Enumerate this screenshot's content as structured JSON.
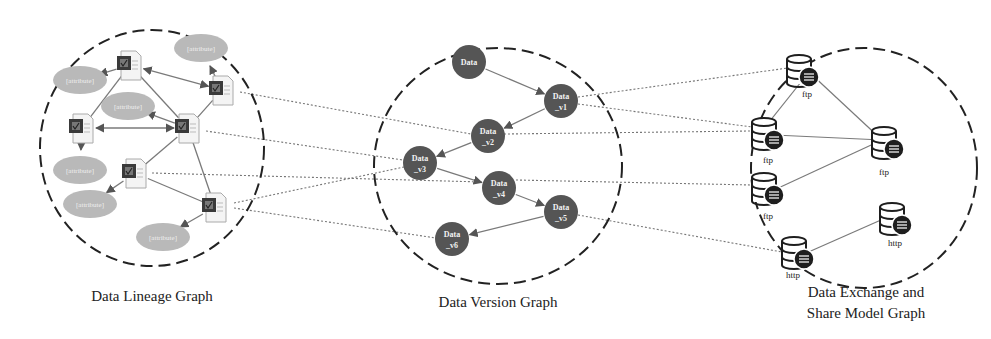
{
  "colors": {
    "background": "#ffffff",
    "boundary": "#222222",
    "cross_link": "#777777",
    "edge": "#7a7a7a",
    "version_node": "#555555",
    "version_text": "#f2f2f2",
    "attribute_fill": "#b9b9b9",
    "attribute_text": "#efefef",
    "doc_dark": "#3a3a3a",
    "db_icon": "#1e1e1e"
  },
  "panels": {
    "lineage": {
      "caption": "Data Lineage Graph",
      "documents": [
        {
          "id": "d1",
          "x": 130,
          "y": 65
        },
        {
          "id": "d2",
          "x": 222,
          "y": 90
        },
        {
          "id": "d3",
          "x": 82,
          "y": 128
        },
        {
          "id": "d4",
          "x": 188,
          "y": 128
        },
        {
          "id": "d5",
          "x": 135,
          "y": 173
        },
        {
          "id": "d6",
          "x": 215,
          "y": 207
        }
      ],
      "attributes": [
        {
          "id": "a1",
          "label": "[attribute]",
          "x": 201,
          "y": 48
        },
        {
          "id": "a2",
          "label": "[attribute]",
          "x": 80,
          "y": 80
        },
        {
          "id": "a3",
          "label": "[attribute]",
          "x": 128,
          "y": 106
        },
        {
          "id": "a4",
          "label": "[attribute]",
          "x": 80,
          "y": 170
        },
        {
          "id": "a5",
          "label": "[attribute]",
          "x": 90,
          "y": 204
        },
        {
          "id": "a6",
          "label": "[attribute]",
          "x": 163,
          "y": 237
        }
      ]
    },
    "version": {
      "caption": "Data Version Graph",
      "nodes": [
        {
          "id": "v0",
          "line1": "Data",
          "line2": "",
          "x": 469,
          "y": 62
        },
        {
          "id": "v1",
          "line1": "Data",
          "line2": "_v1",
          "x": 561,
          "y": 101
        },
        {
          "id": "v2",
          "line1": "Data",
          "line2": "_v2",
          "x": 488,
          "y": 136
        },
        {
          "id": "v3",
          "line1": "Data",
          "line2": "_v3",
          "x": 420,
          "y": 163
        },
        {
          "id": "v4",
          "line1": "Data",
          "line2": "_v4",
          "x": 499,
          "y": 188
        },
        {
          "id": "v5",
          "line1": "Data",
          "line2": "_v5",
          "x": 561,
          "y": 212
        },
        {
          "id": "v6",
          "line1": "Data",
          "line2": "_v6",
          "x": 452,
          "y": 239
        }
      ]
    },
    "exchange": {
      "caption_line1": "Data Exchange and",
      "caption_line2": "Share Model Graph",
      "stores": [
        {
          "id": "s1",
          "label": "ftp",
          "x": 803,
          "y": 70,
          "lx": 807,
          "ly": 97
        },
        {
          "id": "s2",
          "label": "ftp",
          "x": 768,
          "y": 133,
          "lx": 768,
          "ly": 163
        },
        {
          "id": "s3",
          "label": "ftp",
          "x": 888,
          "y": 142,
          "lx": 884,
          "ly": 175
        },
        {
          "id": "s4",
          "label": "ftp",
          "x": 768,
          "y": 188,
          "lx": 768,
          "ly": 219
        },
        {
          "id": "s5",
          "label": "http",
          "x": 896,
          "y": 218,
          "lx": 895,
          "ly": 246
        },
        {
          "id": "s6",
          "label": "http",
          "x": 798,
          "y": 252,
          "lx": 793,
          "ly": 278
        }
      ]
    }
  }
}
